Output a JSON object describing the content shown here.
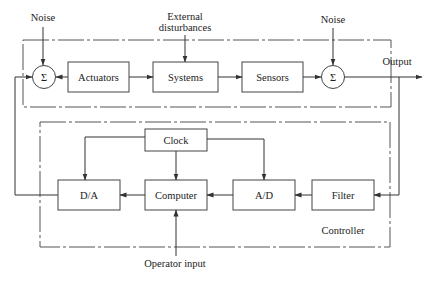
{
  "diagram": {
    "type": "block-diagram",
    "title": "",
    "plant_group": {
      "inputs": {
        "noise_left": "Noise",
        "external_disturbances_line1": "External",
        "external_disturbances_line2": "disturbances",
        "noise_right": "Noise"
      },
      "blocks": {
        "sum_left": "Σ",
        "actuators": "Actuators",
        "systems": "Systems",
        "sensors": "Sensors",
        "sum_right": "Σ"
      },
      "output_label": "Output"
    },
    "controller_group": {
      "label": "Controller",
      "blocks": {
        "clock": "Clock",
        "da": "D/A",
        "computer": "Computer",
        "ad": "A/D",
        "filter": "Filter"
      },
      "operator_input": "Operator input"
    },
    "connections": [
      {
        "from": "Noise",
        "to": "Σ (left)"
      },
      {
        "from": "Σ (left)",
        "to": "Actuators"
      },
      {
        "from": "Actuators",
        "to": "Systems"
      },
      {
        "from": "External disturbances",
        "to": "Systems"
      },
      {
        "from": "Systems",
        "to": "Sensors"
      },
      {
        "from": "Sensors",
        "to": "Σ (right)"
      },
      {
        "from": "Noise",
        "to": "Σ (right)"
      },
      {
        "from": "Σ (right)",
        "to": "Output"
      },
      {
        "from": "Output",
        "to": "Filter"
      },
      {
        "from": "Filter",
        "to": "A/D"
      },
      {
        "from": "A/D",
        "to": "Computer"
      },
      {
        "from": "Computer",
        "to": "D/A"
      },
      {
        "from": "Clock",
        "to": "D/A"
      },
      {
        "from": "Clock",
        "to": "Computer"
      },
      {
        "from": "Clock",
        "to": "A/D"
      },
      {
        "from": "Operator input",
        "to": "Computer"
      },
      {
        "from": "D/A",
        "to": "Σ (left)"
      }
    ]
  }
}
